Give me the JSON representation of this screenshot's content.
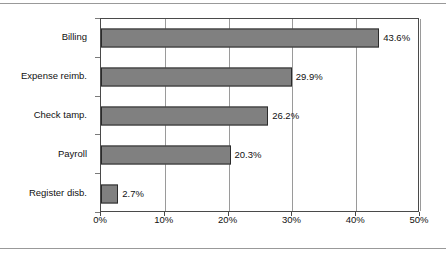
{
  "chart_data": {
    "type": "bar",
    "orientation": "horizontal",
    "title": "",
    "subtitle": "",
    "xlabel": "",
    "ylabel": "",
    "categories": [
      "Billing",
      "Expense reimb.",
      "Check tamp.",
      "Payroll",
      "Register disb."
    ],
    "values": [
      43.6,
      29.9,
      26.2,
      20.3,
      2.7
    ],
    "value_labels": [
      "43.6%",
      "29.9%",
      "26.2%",
      "20.3%",
      "2.7%"
    ],
    "xlim": [
      0,
      50
    ],
    "xtick_values": [
      0,
      10,
      20,
      30,
      40,
      50
    ],
    "xtick_labels": [
      "0%",
      "10%",
      "20%",
      "30%",
      "40%",
      "50%"
    ],
    "grid": "vertical",
    "legend": null,
    "series": [
      {
        "name": "",
        "values": [
          43.6,
          29.9,
          26.2,
          20.3,
          2.7
        ]
      }
    ],
    "colors": {
      "bar_fill": "#808080",
      "bar_border": "#2b2b2b",
      "gridline": "#9a9a9a",
      "axis": "#4a4a4a",
      "text": "#111111",
      "background": "#ffffff",
      "rule": "#999999"
    }
  }
}
